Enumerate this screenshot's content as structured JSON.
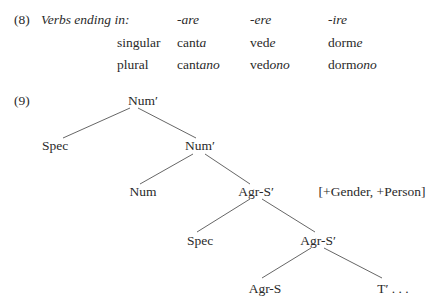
{
  "example8": {
    "number": "(8)",
    "header_label": "Verbs ending in:",
    "columns": [
      "-are",
      "-ere",
      "-ire"
    ],
    "rows": [
      {
        "label": "singular",
        "cells": [
          {
            "stem": "cant",
            "ending": "a"
          },
          {
            "stem": "ved",
            "ending": "e"
          },
          {
            "stem": "dorm",
            "ending": "e"
          }
        ]
      },
      {
        "label": "plural",
        "cells": [
          {
            "stem": "cant",
            "ending": "ano"
          },
          {
            "stem": "ved",
            "ending": "ono"
          },
          {
            "stem": "dorm",
            "ending": "ono"
          }
        ]
      }
    ]
  },
  "example9": {
    "number": "(9)",
    "nodes": {
      "root": "Num′",
      "spec1": "Spec",
      "num_bar": "Num′",
      "num": "Num",
      "agrs_bar1": "Agr-S′",
      "features": "[+Gender, +Person]",
      "spec2": "Spec",
      "agrs_bar2": "Agr-S′",
      "agrs": "Agr-S",
      "t_bar": "T′ . . ."
    }
  }
}
